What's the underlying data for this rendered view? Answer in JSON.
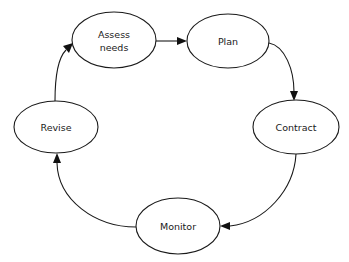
{
  "diagram": {
    "type": "cycle",
    "nodes": [
      {
        "id": "assess",
        "lines": [
          "Assess",
          "needs"
        ],
        "cx": 114,
        "cy": 40,
        "rx": 42,
        "ry": 28
      },
      {
        "id": "plan",
        "lines": [
          "Plan"
        ],
        "cx": 228,
        "cy": 41,
        "rx": 41,
        "ry": 27
      },
      {
        "id": "contract",
        "lines": [
          "Contract"
        ],
        "cx": 296,
        "cy": 127,
        "rx": 43,
        "ry": 27
      },
      {
        "id": "monitor",
        "lines": [
          "Monitor"
        ],
        "cx": 178,
        "cy": 226,
        "rx": 42,
        "ry": 28
      },
      {
        "id": "revise",
        "lines": [
          "Revise"
        ],
        "cx": 56,
        "cy": 127,
        "rx": 42,
        "ry": 26
      }
    ],
    "edges": [
      {
        "from": "assess",
        "to": "plan"
      },
      {
        "from": "plan",
        "to": "contract"
      },
      {
        "from": "contract",
        "to": "monitor"
      },
      {
        "from": "monitor",
        "to": "revise"
      },
      {
        "from": "revise",
        "to": "assess"
      }
    ],
    "colors": {
      "stroke": "#1a1a1a",
      "background": "#ffffff"
    }
  }
}
